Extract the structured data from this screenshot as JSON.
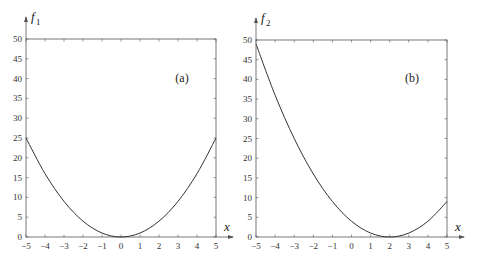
{
  "chart_data": [
    {
      "type": "line",
      "panel_label": "(a)",
      "title": "",
      "xlabel": "x",
      "ylabel": "f",
      "ylabel_subscript": "1",
      "function": "f1 = x^2",
      "xlim": [
        -5,
        5
      ],
      "ylim": [
        0,
        50
      ],
      "xticks": [
        -5,
        -4,
        -3,
        -2,
        -1,
        0,
        1,
        2,
        3,
        4,
        5
      ],
      "yticks": [
        0,
        5,
        10,
        15,
        20,
        25,
        30,
        35,
        40,
        45,
        50
      ],
      "grid": false,
      "legend": "none",
      "series": [
        {
          "name": "f1",
          "x": [
            -5,
            -4,
            -3,
            -2,
            -1,
            0,
            1,
            2,
            3,
            4,
            5
          ],
          "values": [
            25,
            16,
            9,
            4,
            1,
            0,
            1,
            4,
            9,
            16,
            25
          ]
        }
      ]
    },
    {
      "type": "line",
      "panel_label": "(b)",
      "title": "",
      "xlabel": "x",
      "ylabel": "f",
      "ylabel_subscript": "2",
      "function": "f2 = (x-2)^2",
      "xlim": [
        -5,
        5
      ],
      "ylim": [
        0,
        50
      ],
      "xticks": [
        -5,
        -4,
        -3,
        -2,
        -1,
        0,
        1,
        2,
        3,
        4,
        5
      ],
      "yticks": [
        0,
        5,
        10,
        15,
        20,
        25,
        30,
        35,
        40,
        45,
        50
      ],
      "grid": false,
      "legend": "none",
      "series": [
        {
          "name": "f2",
          "x": [
            -5,
            -4,
            -3,
            -2,
            -1,
            0,
            1,
            2,
            3,
            4,
            5
          ],
          "values": [
            49,
            36,
            25,
            16,
            9,
            4,
            1,
            0,
            1,
            4,
            9
          ]
        }
      ]
    }
  ],
  "style": {
    "axis_color": "#555555",
    "curve_color": "#333333"
  }
}
